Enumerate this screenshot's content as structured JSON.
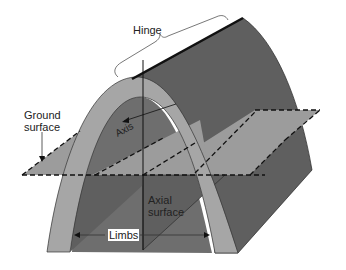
{
  "diagram": {
    "labels": {
      "hinge": "Hinge",
      "ground_surface_line1": "Ground",
      "ground_surface_line2": "surface",
      "axis": "Axis",
      "axial_surface_line1": "Axial",
      "axial_surface_line2": "surface",
      "limbs": "Limbs"
    },
    "colors": {
      "outer_layer": "#a6a6a6",
      "back_face": "#5f5f5f",
      "inner_core": "#6e6e6e",
      "ground_plane": "#9a9a9a",
      "lines": "#111111"
    }
  }
}
